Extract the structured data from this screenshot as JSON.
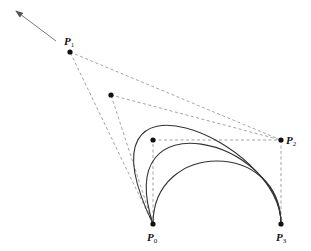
{
  "diagram": {
    "type": "cubic-bezier-control-point-variation",
    "colors": {
      "curve": "#333333",
      "dashed": "#999999",
      "point": "#111111",
      "arrow": "#777777"
    },
    "points": {
      "P0": {
        "label": "P",
        "sub": "0",
        "x": 153,
        "y": 224
      },
      "P1": {
        "label": "P",
        "sub": "1",
        "x": 70,
        "y": 52
      },
      "P2": {
        "label": "P",
        "sub": "2",
        "x": 281,
        "y": 140
      },
      "P3": {
        "label": "P",
        "sub": "3",
        "x": 281,
        "y": 224
      }
    },
    "p1_variants": [
      {
        "x": 70,
        "y": 52
      },
      {
        "x": 111,
        "y": 95
      },
      {
        "x": 153,
        "y": 140
      }
    ],
    "arrow": {
      "from": {
        "x": 56,
        "y": 41
      },
      "to": {
        "x": 16,
        "y": 11
      }
    }
  }
}
